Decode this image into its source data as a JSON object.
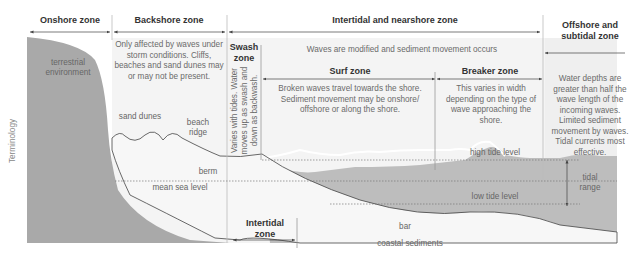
{
  "zones": {
    "onshore": {
      "title": "Onshore zone"
    },
    "backshore": {
      "title": "Backshore zone",
      "description": "Only affected by waves under storm conditions. Cliffs, beaches and sand dunes may or may not be present."
    },
    "intertidal_nearshore": {
      "title": "Intertidal and nearshore zone",
      "description": "Waves are modified and sediment movement occurs"
    },
    "offshore": {
      "title_line1": "Offshore and",
      "title_line2": "subtidal zone",
      "description": "Water depths are greater than half the wave length of the incoming waves. Limited sediment movement by waves. Tidal currents most effective."
    },
    "swash": {
      "title_line1": "Swash",
      "title_line2": "zone",
      "description_line1": "Varies with tides. Water",
      "description_line2": "moves up as swash and",
      "description_line3": "down as backwash."
    },
    "surf": {
      "title": "Surf zone",
      "description": "Broken waves travel towards the shore. Sediment movement may be onshore/ offshore or along the shore."
    },
    "breaker": {
      "title": "Breaker zone",
      "description": "This varies in width depending on the type of wave approaching the shore."
    },
    "intertidal": {
      "title_line1": "Intertidal",
      "title_line2": "zone"
    }
  },
  "labels": {
    "terrestrial_line1": "terrestrial",
    "terrestrial_line2": "environment",
    "sand_dunes": "sand dunes",
    "beach_ridge_line1": "beach",
    "beach_ridge_line2": "ridge",
    "berm": "berm",
    "mean_sea_level": "mean sea level",
    "high_tide_level": "high tide level",
    "low_tide_level": "low tide level",
    "tidal_range_line1": "tidal",
    "tidal_range_line2": "range",
    "bar": "bar",
    "coastal_sediments": "coastal sediments",
    "axis_label": "Terminology"
  },
  "colors": {
    "land": "#a9a9a9",
    "water": "#bdbdbd",
    "panel": "#f3f3f3",
    "lines": "#444444"
  }
}
